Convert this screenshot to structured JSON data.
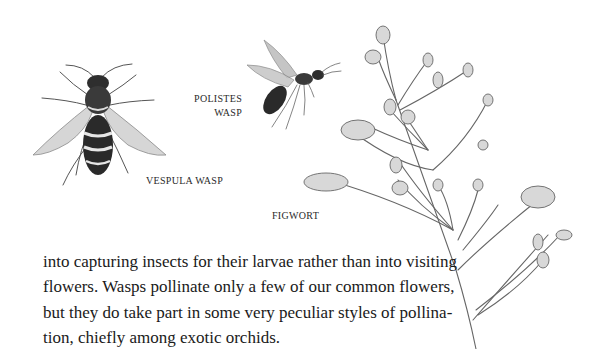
{
  "illustrations": [
    {
      "id": "vespula",
      "label": "Vespula wasp illustration"
    },
    {
      "id": "polistes",
      "label": "Polistes wasp illustration"
    },
    {
      "id": "figwort",
      "label": "Figwort plant illustration"
    }
  ],
  "captions": {
    "polistes_line1": "POLISTES",
    "polistes_line2": "WASP",
    "vespula": "VESPULA WASP",
    "figwort": "FIGWORT"
  },
  "body": {
    "lines": [
      "into capturing insects for their larvae rather than into visiting",
      "flowers. Wasps pollinate only a few of our common flowers,",
      "but they do take part in some very peculiar styles of pollina-",
      "tion, chiefly among exotic orchids."
    ]
  }
}
